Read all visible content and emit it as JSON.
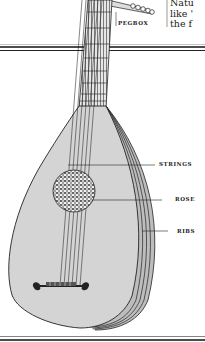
{
  "figure": {
    "body_color": "#d4d4d4",
    "line_color": "#222222"
  },
  "labels": {
    "pegbox": "PEGBOX",
    "strings": "STRINGS",
    "rose": "ROSE",
    "ribs": "RIBS"
  },
  "side_text": {
    "lines": [
      "Natu",
      "like '",
      "the f"
    ]
  }
}
